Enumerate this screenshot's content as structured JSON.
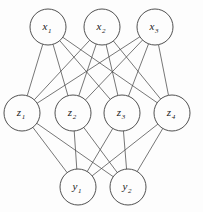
{
  "diagram": {
    "type": "neural-network-graph",
    "background_color": "#fdfdfd",
    "edge_color": "#4a4a4a",
    "node_stroke_color": "#3d3d3d",
    "node_fill_color": "#fdfdfd",
    "label_color": "#1a1a1a",
    "node_radius": 18,
    "layers": [
      {
        "id": "input",
        "name": "input-layer",
        "y": 27,
        "nodes": [
          {
            "id": "x1",
            "base": "x",
            "sub": "1",
            "cx": 48,
            "cy": 27
          },
          {
            "id": "x2",
            "base": "x",
            "sub": "2",
            "cx": 102,
            "cy": 27
          },
          {
            "id": "x3",
            "base": "x",
            "sub": "3",
            "cx": 155,
            "cy": 27
          }
        ]
      },
      {
        "id": "hidden",
        "name": "hidden-layer",
        "y": 113,
        "nodes": [
          {
            "id": "z1",
            "base": "z",
            "sub": "1",
            "cx": 22,
            "cy": 113
          },
          {
            "id": "z2",
            "base": "z",
            "sub": "2",
            "cx": 73,
            "cy": 113
          },
          {
            "id": "z3",
            "base": "z",
            "sub": "3",
            "cx": 122,
            "cy": 113
          },
          {
            "id": "z4",
            "base": "z",
            "sub": "4",
            "cx": 172,
            "cy": 113
          }
        ]
      },
      {
        "id": "output",
        "name": "output-layer",
        "y": 187,
        "nodes": [
          {
            "id": "y1",
            "base": "y",
            "sub": "1",
            "cx": 78,
            "cy": 187
          },
          {
            "id": "y2",
            "base": "y",
            "sub": "2",
            "cx": 128,
            "cy": 187
          }
        ]
      }
    ],
    "edges": [
      {
        "from": "x1",
        "to": "z1"
      },
      {
        "from": "x1",
        "to": "z2"
      },
      {
        "from": "x1",
        "to": "z3"
      },
      {
        "from": "x1",
        "to": "z4"
      },
      {
        "from": "x2",
        "to": "z1"
      },
      {
        "from": "x2",
        "to": "z2"
      },
      {
        "from": "x2",
        "to": "z3"
      },
      {
        "from": "x2",
        "to": "z4"
      },
      {
        "from": "x3",
        "to": "z1"
      },
      {
        "from": "x3",
        "to": "z2"
      },
      {
        "from": "x3",
        "to": "z3"
      },
      {
        "from": "x3",
        "to": "z4"
      },
      {
        "from": "z1",
        "to": "y1"
      },
      {
        "from": "z1",
        "to": "y2"
      },
      {
        "from": "z2",
        "to": "y1"
      },
      {
        "from": "z2",
        "to": "y2"
      },
      {
        "from": "z3",
        "to": "y1"
      },
      {
        "from": "z3",
        "to": "y2"
      },
      {
        "from": "z4",
        "to": "y1"
      },
      {
        "from": "z4",
        "to": "y2"
      }
    ]
  }
}
